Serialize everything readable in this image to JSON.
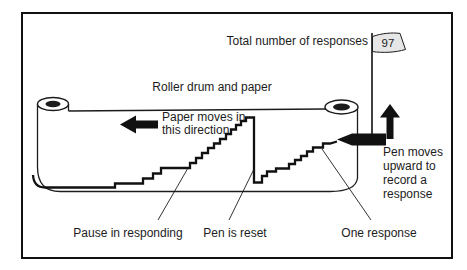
{
  "figure": {
    "counter": {
      "label": "Total number of responses",
      "value": "97"
    },
    "roller": {
      "label": "Roller drum and paper"
    },
    "paper_direction": {
      "line1": "Paper moves in",
      "line2": "this direction"
    },
    "pen": {
      "line1": "Pen moves",
      "line2": "upward to",
      "line3": "record a",
      "line4": "response"
    },
    "annotations": {
      "pause": "Pause in responding",
      "reset": "Pen is reset",
      "one_response": "One response"
    },
    "colors": {
      "ink": "#1c1c1c",
      "flag_fill": "#e6e6e6",
      "paper": "#ffffff"
    }
  }
}
